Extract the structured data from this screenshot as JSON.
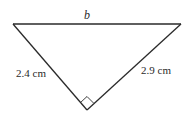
{
  "figure": {
    "type": "right-triangle",
    "vertices": {
      "top_left": [
        13,
        24
      ],
      "top_right": [
        181,
        24
      ],
      "bottom": [
        87,
        110
      ]
    },
    "labels": {
      "top_side": "b",
      "left_side": "2.4 cm",
      "right_side": "2.9 cm"
    },
    "right_angle_marker": "bottom",
    "stroke_color": "#2a2a2a"
  }
}
